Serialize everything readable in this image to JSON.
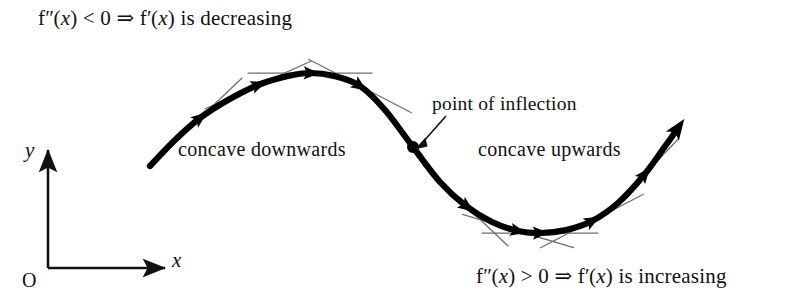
{
  "figure": {
    "background_color": "#ffffff",
    "curve_color": "#000000",
    "tangent_color": "#6e6e6e",
    "axis_color": "#111111",
    "text_color": "#111111"
  },
  "annotations": {
    "top_condition": {
      "full_text": "f″(x) < 0 ⇒ f′(x) is decreasing",
      "f_symbol": "f",
      "second_derivative_prime": "″",
      "variable_open": "(",
      "variable": "x",
      "variable_close": ")",
      "relation": "< 0",
      "implies": "⇒",
      "first_derivative_prime": "′",
      "conclusion": "is decreasing"
    },
    "bottom_condition": {
      "full_text": "f″(x) > 0 ⇒ f′(x) is increasing",
      "f_symbol": "f",
      "second_derivative_prime": "″",
      "variable_open": "(",
      "variable": "x",
      "variable_close": ")",
      "relation": "> 0",
      "implies": "⇒",
      "first_derivative_prime": "′",
      "conclusion": "is increasing"
    },
    "concave_down_label": "concave downwards",
    "concave_up_label": "concave upwards",
    "inflection_label": "point of inflection"
  },
  "axes": {
    "y_label": "y",
    "x_label": "x",
    "origin_label": "O",
    "y_axis": {
      "x": 48,
      "y_top": 147,
      "y_bottom": 268
    },
    "x_axis": {
      "y": 268,
      "x_left": 48,
      "x_right": 168
    }
  },
  "chart_data": {
    "type": "line",
    "title": "",
    "xlabel": "x",
    "ylabel": "y",
    "grid": false,
    "legend": false,
    "curve_points": [
      [
        150,
        166
      ],
      [
        175,
        140
      ],
      [
        200,
        118
      ],
      [
        228,
        100
      ],
      [
        258,
        85
      ],
      [
        288,
        76
      ],
      [
        310,
        73
      ],
      [
        334,
        76
      ],
      [
        360,
        86
      ],
      [
        385,
        110
      ],
      [
        413,
        147
      ],
      [
        440,
        182
      ],
      [
        466,
        206
      ],
      [
        492,
        222
      ],
      [
        518,
        231
      ],
      [
        540,
        233
      ],
      [
        566,
        230
      ],
      [
        592,
        221
      ],
      [
        618,
        203
      ],
      [
        644,
        175
      ],
      [
        666,
        145
      ],
      [
        678,
        128
      ]
    ],
    "tangent_points": [
      {
        "x": 200,
        "y": 118,
        "slope": -0.95,
        "half_length": 58,
        "note": "steep positive-to-flat on concave-down arc"
      },
      {
        "x": 258,
        "y": 85,
        "slope": -0.45,
        "half_length": 58,
        "note": "flattening"
      },
      {
        "x": 310,
        "y": 73,
        "slope": 0.0,
        "half_length": 62,
        "note": "horizontal tangent at maximum"
      },
      {
        "x": 360,
        "y": 86,
        "slope": 0.52,
        "half_length": 58,
        "note": "descending"
      },
      {
        "x": 413,
        "y": 147,
        "slope": 1.32,
        "half_length": 40,
        "note": "steepest negative slope at inflection"
      },
      {
        "x": 466,
        "y": 206,
        "slope": 0.95,
        "half_length": 58,
        "note": "on concave-up arc"
      },
      {
        "x": 518,
        "y": 231,
        "slope": 0.3,
        "half_length": 58,
        "note": "approaching minimum"
      },
      {
        "x": 540,
        "y": 233,
        "slope": 0.0,
        "half_length": 58,
        "note": "horizontal tangent at minimum"
      },
      {
        "x": 592,
        "y": 221,
        "slope": -0.52,
        "half_length": 58,
        "note": "rising"
      },
      {
        "x": 644,
        "y": 175,
        "slope": -1.05,
        "half_length": 50,
        "note": "steep rise"
      }
    ],
    "direction_arrow_points": [
      {
        "x": 200,
        "y": 118
      },
      {
        "x": 258,
        "y": 85
      },
      {
        "x": 310,
        "y": 73
      },
      {
        "x": 360,
        "y": 86
      },
      {
        "x": 466,
        "y": 206
      },
      {
        "x": 518,
        "y": 231
      },
      {
        "x": 540,
        "y": 233
      },
      {
        "x": 592,
        "y": 221
      },
      {
        "x": 644,
        "y": 175
      }
    ],
    "inflection_point": {
      "x": 413,
      "y": 147,
      "radius": 6,
      "label": "point of inflection"
    },
    "maximum_point": {
      "x": 310,
      "y": 73
    },
    "minimum_point": {
      "x": 540,
      "y": 233
    },
    "curve_start": {
      "x": 150,
      "y": 166
    },
    "curve_end": {
      "x": 678,
      "y": 128,
      "has_arrowhead": true
    }
  }
}
